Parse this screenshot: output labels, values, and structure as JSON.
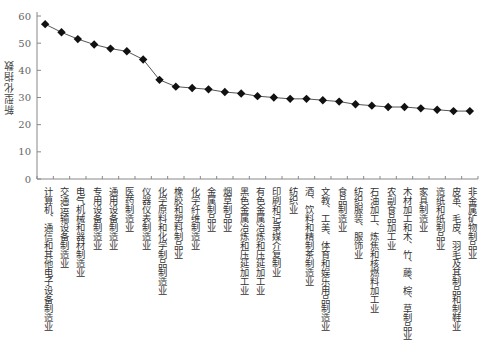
{
  "chart_data": {
    "type": "line",
    "title": "",
    "xlabel": "",
    "ylabel": "新型化指数",
    "ylim": [
      0,
      60
    ],
    "yticks": [
      0,
      10,
      20,
      30,
      40,
      50,
      60
    ],
    "grid": false,
    "legend": null,
    "marker": "diamond",
    "categories": [
      "计算机、通信和其他电子设备制造业",
      "交通运输设备制造业",
      "电气机械和器材制造业",
      "专用设备制造业",
      "通用设备制造业",
      "医药制造业",
      "仪器仪表制造业",
      "化学原料和化学制品制造业",
      "橡胶和塑料制品业",
      "化学纤维制造业",
      "金属制品业",
      "烟草制品业",
      "黑色金属冶炼和压延加工业",
      "有色金属冶炼和压延加工业",
      "印刷和记录媒介复制业",
      "纺织业",
      "酒、饮料和精制茶制造业",
      "文教、工美、体育和娱乐用品制造业",
      "食品制造业",
      "纺织服装、服饰业",
      "石油加工、炼焦和核燃料加工业",
      "农副食品加工业",
      "木材加工和木、竹、藤、棕、草制品业",
      "家具制造业",
      "造纸和纸制品业",
      "皮革、毛皮、羽毛及其制品和制鞋业",
      "非金属矿物制品业"
    ],
    "values": [
      57,
      54,
      51.5,
      49.5,
      48,
      47,
      44,
      36.5,
      34,
      33.5,
      33,
      32,
      31.5,
      30.5,
      30,
      29.5,
      29.5,
      29,
      28.5,
      27.5,
      27,
      26.5,
      26.5,
      26,
      25.5,
      25,
      25
    ]
  }
}
